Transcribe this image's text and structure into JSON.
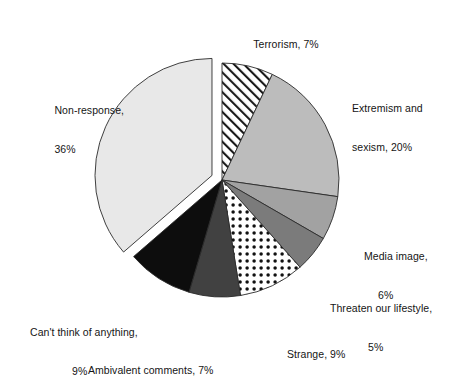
{
  "chart_data": {
    "type": "pie",
    "title": "",
    "subtitle": "",
    "xlabel": "",
    "ylabel": "",
    "legend_position": "none",
    "grid": false,
    "labels_show_percent": true,
    "start_angle_deg": 0,
    "direction": "clockwise",
    "categories": [
      "Terrorism",
      "Extremism and sexism",
      "Media image",
      "Threaten our lifestyle",
      "Strange",
      "Ambivalent comments",
      "Can't think of anything",
      "Non-response"
    ],
    "values": [
      7,
      20,
      6,
      5,
      9,
      7,
      9,
      36
    ],
    "unit": "%",
    "total": 99,
    "slices": [
      {
        "name": "Terrorism",
        "value": 7,
        "label_line1": "Terrorism, 7%",
        "label_line2": "",
        "fill": "#ffffff",
        "pattern": "diagonal-hatch",
        "pattern_color": "#1a1a1a",
        "exploded": false
      },
      {
        "name": "Extremism and sexism",
        "value": 20,
        "label_line1": "Extremism and",
        "label_line2": "sexism, 20%",
        "fill": "#bcbcbc",
        "pattern": "solid",
        "pattern_color": "",
        "exploded": false
      },
      {
        "name": "Media image",
        "value": 6,
        "label_line1": "Media image,",
        "label_line2": "6%",
        "fill": "#a2a2a2",
        "pattern": "solid",
        "pattern_color": "",
        "exploded": false
      },
      {
        "name": "Threaten our lifestyle",
        "value": 5,
        "label_line1": "Threaten our lifestyle,",
        "label_line2": "5%",
        "fill": "#7b7b7b",
        "pattern": "solid",
        "pattern_color": "",
        "exploded": false
      },
      {
        "name": "Strange",
        "value": 9,
        "label_line1": "Strange, 9%",
        "label_line2": "",
        "fill": "#ffffff",
        "pattern": "dots",
        "pattern_color": "#111111",
        "exploded": false
      },
      {
        "name": "Ambivalent comments",
        "value": 7,
        "label_line1": "Ambivalent comments, 7%",
        "label_line2": "",
        "fill": "#414141",
        "pattern": "solid",
        "pattern_color": "",
        "exploded": false
      },
      {
        "name": "Can't think of anything",
        "value": 9,
        "label_line1": "Can't think of anything,",
        "label_line2": "9%",
        "fill": "#0d0d0d",
        "pattern": "solid",
        "pattern_color": "",
        "exploded": false
      },
      {
        "name": "Non-response",
        "value": 36,
        "label_line1": "Non-response,",
        "label_line2": "36%",
        "fill": "#e8e8e8",
        "pattern": "solid",
        "pattern_color": "",
        "exploded": true
      }
    ]
  }
}
